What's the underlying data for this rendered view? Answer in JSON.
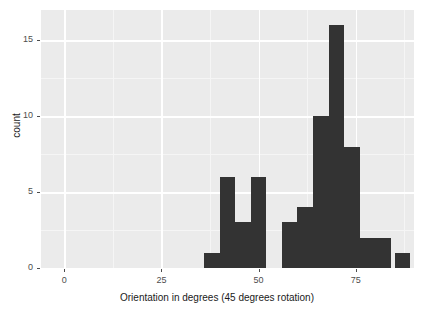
{
  "chart_data": {
    "type": "bar",
    "title": "",
    "subtitle": "",
    "xlabel": "Orientation in degrees (45 degrees rotation)",
    "ylabel": "count",
    "xlim": [
      -6,
      90
    ],
    "ylim": [
      0,
      17
    ],
    "xticks": [
      0,
      25,
      50,
      75
    ],
    "xtick_labels": [
      "0",
      "25",
      "50",
      "75"
    ],
    "yticks": [
      0,
      5,
      10,
      15
    ],
    "ytick_labels": [
      "0",
      "5",
      "10",
      "15"
    ],
    "grid": true,
    "legend": "none",
    "bin_width": 4,
    "bar_color": "#333333",
    "panel_color": "#ebebeb",
    "gridline_color": "#ffffff",
    "categories": [
      36,
      40,
      44,
      48,
      52,
      56,
      60,
      64,
      68,
      72,
      76,
      80,
      84
    ],
    "values": [
      1,
      6,
      3,
      6,
      0,
      3,
      4,
      10,
      16,
      8,
      2,
      2,
      1
    ],
    "bars": [
      {
        "x0": 36,
        "x1": 40,
        "count": 1
      },
      {
        "x0": 40,
        "x1": 44,
        "count": 6
      },
      {
        "x0": 44,
        "x1": 48,
        "count": 3
      },
      {
        "x0": 48,
        "x1": 52,
        "count": 6
      },
      {
        "x0": 52,
        "x1": 56,
        "count": 0
      },
      {
        "x0": 56,
        "x1": 60,
        "count": 3
      },
      {
        "x0": 60,
        "x1": 64,
        "count": 4
      },
      {
        "x0": 64,
        "x1": 68,
        "count": 10
      },
      {
        "x0": 68,
        "x1": 72,
        "count": 16
      },
      {
        "x0": 72,
        "x1": 76,
        "count": 8
      },
      {
        "x0": 76,
        "x1": 80,
        "count": 2
      },
      {
        "x0": 80,
        "x1": 84,
        "count": 2
      },
      {
        "x0": 85,
        "x1": 89,
        "count": 1
      }
    ]
  }
}
